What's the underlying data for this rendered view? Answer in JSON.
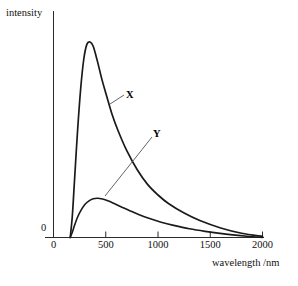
{
  "chart_data": {
    "type": "line",
    "title": "",
    "xlabel": "wavelength /nm",
    "ylabel": "intensity",
    "xlim": [
      0,
      2000
    ],
    "ylim": [
      0,
      1
    ],
    "xticks": [
      0,
      500,
      1000,
      1500,
      2000
    ],
    "xtick_labels": [
      "0",
      "500",
      "1000",
      "1500",
      "2000"
    ],
    "yticks": [
      0
    ],
    "ytick_labels": [
      "0"
    ],
    "grid": false,
    "legend_position": "inline-annotation",
    "series": [
      {
        "name": "X",
        "label": "X",
        "color": "#1a1a1a",
        "annotation": "X",
        "peak_x": 350,
        "peak_y": 0.92,
        "x": [
          160,
          180,
          200,
          230,
          260,
          290,
          320,
          350,
          380,
          420,
          460,
          500,
          560,
          620,
          700,
          800,
          900,
          1000,
          1100,
          1250,
          1400,
          1600,
          1800,
          2000
        ],
        "y": [
          0.0,
          0.1,
          0.26,
          0.5,
          0.7,
          0.84,
          0.91,
          0.92,
          0.9,
          0.83,
          0.75,
          0.68,
          0.58,
          0.5,
          0.41,
          0.32,
          0.25,
          0.2,
          0.16,
          0.115,
          0.08,
          0.045,
          0.02,
          0.005
        ]
      },
      {
        "name": "Y",
        "label": "Y",
        "color": "#1a1a1a",
        "annotation": "Y",
        "peak_x": 420,
        "peak_y": 0.185,
        "x": [
          160,
          180,
          200,
          230,
          260,
          300,
          340,
          380,
          420,
          470,
          520,
          580,
          650,
          730,
          820,
          920,
          1030,
          1150,
          1300,
          1450,
          1650,
          1850,
          2000
        ],
        "y": [
          0.0,
          0.025,
          0.055,
          0.095,
          0.125,
          0.155,
          0.172,
          0.182,
          0.185,
          0.181,
          0.173,
          0.16,
          0.144,
          0.126,
          0.107,
          0.089,
          0.072,
          0.057,
          0.041,
          0.029,
          0.016,
          0.006,
          0.0
        ]
      }
    ]
  },
  "axes": {
    "y_axis_label": "intensity",
    "x_axis_label": "wavelength /nm",
    "y_zero": "0"
  },
  "icons": {
    "leader_line_x": "leader-line-icon",
    "leader_line_y": "leader-line-icon"
  }
}
